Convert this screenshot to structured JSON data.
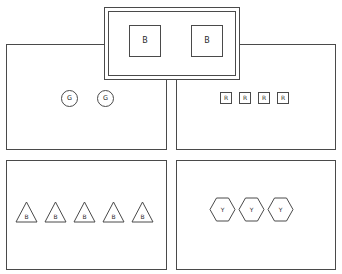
{
  "diagram": {
    "background_color": "#ffffff",
    "stroke_color": "#4a4a4a",
    "label_color": "#2b2b2b",
    "panels": [
      {
        "id": "overlay",
        "name": "overlay-panel",
        "border_style": "double",
        "shape_type": "square",
        "shape_count": 2,
        "items": [
          {
            "label": "B"
          },
          {
            "label": "B"
          }
        ]
      },
      {
        "id": "middle-left",
        "name": "middle-left-panel",
        "border_style": "single",
        "shape_type": "circle",
        "shape_count": 2,
        "items": [
          {
            "label": "G"
          },
          {
            "label": "G"
          }
        ]
      },
      {
        "id": "middle-right",
        "name": "middle-right-panel",
        "border_style": "single",
        "shape_type": "square",
        "shape_count": 4,
        "items": [
          {
            "label": "R"
          },
          {
            "label": "R"
          },
          {
            "label": "R"
          },
          {
            "label": "R"
          }
        ]
      },
      {
        "id": "bottom-left",
        "name": "bottom-left-panel",
        "border_style": "single",
        "shape_type": "triangle",
        "shape_count": 5,
        "items": [
          {
            "label": "B"
          },
          {
            "label": "B"
          },
          {
            "label": "B"
          },
          {
            "label": "B"
          },
          {
            "label": "B"
          }
        ]
      },
      {
        "id": "bottom-right",
        "name": "bottom-right-panel",
        "border_style": "single",
        "shape_type": "hexagon",
        "shape_count": 3,
        "items": [
          {
            "label": "Y"
          },
          {
            "label": "Y"
          },
          {
            "label": "Y"
          }
        ]
      }
    ]
  }
}
